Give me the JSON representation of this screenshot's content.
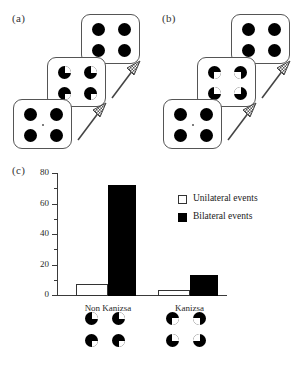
{
  "figure": {
    "panels": [
      {
        "id": "a",
        "label": "(a)",
        "condition": "Non Kanizsa sequence"
      },
      {
        "id": "b",
        "label": "(b)",
        "condition": "Kanizsa sequence"
      },
      {
        "id": "c",
        "label": "(c)",
        "condition": "Results bar chart"
      }
    ]
  },
  "stimuli": {
    "full_disc_card_label": "four-black-discs-card",
    "non_kanizsa_card_label": "outward-wedge-discs-card",
    "kanizsa_card_label": "inward-pacman-inducers-card",
    "fixation_label": "central-fixation-point",
    "arrow_label": "time-progression-arrow"
  },
  "chart_data": {
    "type": "bar",
    "title": "",
    "xlabel": "",
    "ylabel": "",
    "categories": [
      "Non Kanizsa",
      "Kanizsa"
    ],
    "series": [
      {
        "name": "Unilateral events",
        "values": [
          7,
          3.5
        ],
        "color": "#ffffff"
      },
      {
        "name": "Bilateral events",
        "values": [
          72,
          13
        ],
        "color": "#000000"
      }
    ],
    "ylim": [
      0,
      80
    ],
    "yticks": [
      0,
      20,
      40,
      60,
      80
    ],
    "ytick_labels": [
      "0",
      "20",
      "40",
      "60",
      "80"
    ],
    "yminor_step": 10,
    "grid": false,
    "legend_position": "upper right",
    "legend_entries": [
      "Unilateral events",
      "Bilateral events"
    ],
    "category_icons": [
      "outward-wedge-discs",
      "inward-pacman-inducers"
    ]
  }
}
